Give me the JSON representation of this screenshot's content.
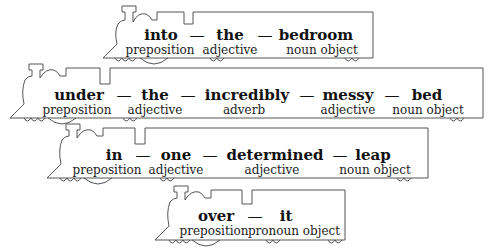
{
  "trains": [
    {
      "words": [
        "into",
        "the",
        "bedroom"
      ],
      "labels": [
        "preposition",
        "adjective",
        "noun object"
      ],
      "separator": "—"
    },
    {
      "words": [
        "under",
        "the",
        "incredibly",
        "messy",
        "bed"
      ],
      "labels": [
        "preposition",
        "adjective",
        "adverb",
        "adjective",
        "noun object"
      ],
      "separator": "—"
    },
    {
      "words": [
        "in",
        "one",
        "determined",
        "leap"
      ],
      "labels": [
        "preposition",
        "adjective",
        "adjective",
        "noun object"
      ],
      "separator": "—"
    },
    {
      "words": [
        "over",
        "it"
      ],
      "labels": [
        "preposition",
        "pronoun object"
      ],
      "separator": "—"
    }
  ],
  "colors": {
    "outline": "#555555",
    "text": "#111111",
    "background": "#ffffff"
  }
}
